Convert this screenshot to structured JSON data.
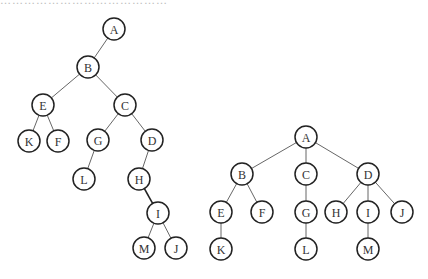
{
  "caption_fragment": "……………………………………",
  "trees": [
    {
      "id": "binary-tree",
      "radius": 11,
      "nodes": [
        {
          "label": "A",
          "x": 114,
          "y": 29
        },
        {
          "label": "B",
          "x": 88,
          "y": 67
        },
        {
          "label": "E",
          "x": 43,
          "y": 105
        },
        {
          "label": "C",
          "x": 125,
          "y": 105
        },
        {
          "label": "K",
          "x": 29,
          "y": 141
        },
        {
          "label": "F",
          "x": 58,
          "y": 141
        },
        {
          "label": "G",
          "x": 98,
          "y": 140
        },
        {
          "label": "D",
          "x": 152,
          "y": 140
        },
        {
          "label": "L",
          "x": 84,
          "y": 179
        },
        {
          "label": "H",
          "x": 139,
          "y": 179
        },
        {
          "label": "I",
          "x": 158,
          "y": 213
        },
        {
          "label": "M",
          "x": 144,
          "y": 248
        },
        {
          "label": "J",
          "x": 176,
          "y": 248
        }
      ],
      "edges": [
        [
          "A",
          "B"
        ],
        [
          "B",
          "E"
        ],
        [
          "B",
          "C"
        ],
        [
          "E",
          "K"
        ],
        [
          "E",
          "F"
        ],
        [
          "C",
          "G"
        ],
        [
          "C",
          "D"
        ],
        [
          "G",
          "L"
        ],
        [
          "D",
          "H"
        ],
        [
          "H",
          "I"
        ],
        [
          "I",
          "M"
        ],
        [
          "I",
          "J"
        ]
      ],
      "bold_edges": [
        [
          "H",
          "I"
        ]
      ]
    },
    {
      "id": "general-tree",
      "radius": 11,
      "nodes": [
        {
          "label": "A",
          "x": 306,
          "y": 137
        },
        {
          "label": "B",
          "x": 242,
          "y": 174
        },
        {
          "label": "C",
          "x": 306,
          "y": 174
        },
        {
          "label": "D",
          "x": 368,
          "y": 174
        },
        {
          "label": "E",
          "x": 221,
          "y": 212
        },
        {
          "label": "F",
          "x": 262,
          "y": 212
        },
        {
          "label": "G",
          "x": 306,
          "y": 212
        },
        {
          "label": "H",
          "x": 336,
          "y": 212
        },
        {
          "label": "I",
          "x": 368,
          "y": 212
        },
        {
          "label": "J",
          "x": 402,
          "y": 212
        },
        {
          "label": "K",
          "x": 221,
          "y": 249
        },
        {
          "label": "L",
          "x": 306,
          "y": 249
        },
        {
          "label": "M",
          "x": 368,
          "y": 249
        }
      ],
      "edges": [
        [
          "A",
          "B"
        ],
        [
          "A",
          "C"
        ],
        [
          "A",
          "D"
        ],
        [
          "B",
          "E"
        ],
        [
          "B",
          "F"
        ],
        [
          "C",
          "G"
        ],
        [
          "D",
          "H"
        ],
        [
          "D",
          "I"
        ],
        [
          "D",
          "J"
        ],
        [
          "E",
          "K"
        ],
        [
          "G",
          "L"
        ],
        [
          "I",
          "M"
        ]
      ],
      "bold_edges": []
    }
  ]
}
